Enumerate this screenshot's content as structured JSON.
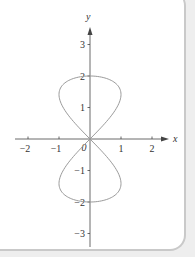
{
  "chart_data": {
    "type": "line",
    "title": "",
    "xlabel": "x",
    "ylabel": "y",
    "xlim": [
      -2.5,
      2.5
    ],
    "ylim": [
      -3.5,
      3.5
    ],
    "grid": false,
    "legend": null,
    "x_ticks": [
      -2,
      -1,
      0,
      1,
      2
    ],
    "y_ticks": [
      -3,
      -2,
      -1,
      1,
      2,
      3
    ],
    "x_tick_labels": [
      "−2",
      "−1",
      "0",
      "1",
      "2"
    ],
    "y_tick_labels": [
      "−3",
      "−2",
      "−1",
      "1",
      "2",
      "3"
    ],
    "origin_label": "0",
    "series": [
      {
        "name": "parametric curve (figure-eight)",
        "description": "x = sin(2t), y = 2cos(t), 0 ≤ t ≤ 2π",
        "color": "#9a9a9a",
        "points": [
          [
            0,
            2
          ],
          [
            0.5,
            1.93
          ],
          [
            0.87,
            1.73
          ],
          [
            1.0,
            1.41
          ],
          [
            0.87,
            1.0
          ],
          [
            0.5,
            0.52
          ],
          [
            0,
            0
          ],
          [
            -0.5,
            -0.52
          ],
          [
            -0.87,
            -1.0
          ],
          [
            -1.0,
            -1.41
          ],
          [
            -0.87,
            -1.73
          ],
          [
            -0.5,
            -1.93
          ],
          [
            0,
            -2
          ],
          [
            0.5,
            -1.93
          ],
          [
            0.87,
            -1.73
          ],
          [
            1.0,
            -1.41
          ],
          [
            0.87,
            -1.0
          ],
          [
            0.5,
            -0.52
          ],
          [
            0,
            0
          ],
          [
            -0.5,
            0.52
          ],
          [
            -0.87,
            1.0
          ],
          [
            -1.0,
            1.41
          ],
          [
            -0.87,
            1.73
          ],
          [
            -0.5,
            1.93
          ],
          [
            0,
            2
          ]
        ]
      }
    ]
  },
  "colors": {
    "axis": "#444444",
    "curve": "#9a9a9a",
    "panel_border": "#c9c9c9",
    "background": "#ffffff"
  }
}
